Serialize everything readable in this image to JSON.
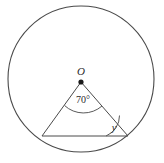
{
  "figure": {
    "kind": "circle-geometry-diagram",
    "background_color": "#ffffff",
    "stroke_color": "#4a4a4a",
    "labels": {
      "center_point": "O",
      "central_angle": "70°",
      "base_angle": "y"
    },
    "geometry": {
      "circle": {
        "cx": 81,
        "cy": 79,
        "r": 73
      },
      "center_dot": {
        "cx": 81,
        "cy": 82,
        "r": 2.6
      },
      "chord": {
        "x1": 42,
        "y1": 136,
        "x2": 128,
        "y2": 136
      },
      "radius_left": {
        "x1": 81,
        "y1": 82,
        "x2": 42,
        "y2": 136
      },
      "radius_right": {
        "x1": 81,
        "y1": 82,
        "x2": 128,
        "y2": 136
      },
      "central_angle_arc": "M 64.5 105.5 A 28 28 0 0 0 102 106",
      "base_angle_arc": "M 106 136 A 22 22 0 0 0 119.5 115.5"
    },
    "label_positions": {
      "center_label": {
        "x": 81,
        "y": 75
      },
      "central_angle_label": {
        "x": 83,
        "y": 103
      },
      "base_angle_label": {
        "x": 114,
        "y": 131
      }
    }
  }
}
